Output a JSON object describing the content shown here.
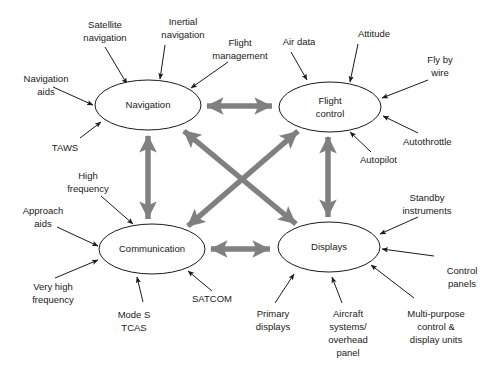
{
  "figure": {
    "background_color": "#ffffff",
    "node_stroke_color": "#1a1a1a",
    "link_color": "#808080",
    "annotation_color": "#1a1a1a"
  },
  "nodes": [
    {
      "id": "navigation",
      "label": "Navigation",
      "label_line2": "",
      "cx": 148,
      "cy": 105,
      "rx": 53,
      "ry": 25
    },
    {
      "id": "flight-control",
      "label": "Flight",
      "label_line2": "control",
      "cx": 330,
      "cy": 107,
      "rx": 51,
      "ry": 25
    },
    {
      "id": "communication",
      "label": "Communication",
      "label_line2": "",
      "cx": 152,
      "cy": 249,
      "rx": 53,
      "ry": 25
    },
    {
      "id": "displays",
      "label": "Displays",
      "label_line2": "",
      "cx": 329,
      "cy": 247,
      "rx": 51,
      "ry": 25
    }
  ],
  "links": [
    {
      "id": "nav-flight",
      "from": "navigation",
      "to": "flight-control",
      "style": "double-arrow",
      "orientation": "horizontal"
    },
    {
      "id": "comm-displays",
      "from": "communication",
      "to": "displays",
      "style": "double-arrow",
      "orientation": "horizontal"
    },
    {
      "id": "nav-comm",
      "from": "navigation",
      "to": "communication",
      "style": "double-arrow",
      "orientation": "vertical"
    },
    {
      "id": "flight-displays",
      "from": "flight-control",
      "to": "displays",
      "style": "double-arrow",
      "orientation": "vertical"
    },
    {
      "id": "nav-displays",
      "from": "navigation",
      "to": "displays",
      "style": "double-arrow",
      "orientation": "diagonal"
    },
    {
      "id": "comm-flight",
      "from": "communication",
      "to": "flight-control",
      "style": "double-arrow",
      "orientation": "diagonal"
    }
  ],
  "annotations": {
    "navigation": [
      {
        "id": "satellite-navigation",
        "line1": "Satellite",
        "line2": "navigation"
      },
      {
        "id": "inertial-navigation",
        "line1": "Inertial",
        "line2": "navigation"
      },
      {
        "id": "flight-management",
        "line1": "Flight",
        "line2": "management"
      },
      {
        "id": "navigation-aids",
        "line1": "Navigation",
        "line2": "aids"
      },
      {
        "id": "taws",
        "line1": "TAWS",
        "line2": ""
      }
    ],
    "flight_control": [
      {
        "id": "air-data",
        "line1": "Air data",
        "line2": ""
      },
      {
        "id": "attitude",
        "line1": "Attitude",
        "line2": ""
      },
      {
        "id": "fly-by-wire",
        "line1": "Fly by",
        "line2": "wire"
      },
      {
        "id": "autothrottle",
        "line1": "Autothrottle",
        "line2": ""
      },
      {
        "id": "autopilot",
        "line1": "Autopilot",
        "line2": ""
      }
    ],
    "communication": [
      {
        "id": "high-frequency",
        "line1": "High",
        "line2": "frequency"
      },
      {
        "id": "approach-aids",
        "line1": "Approach",
        "line2": "aids"
      },
      {
        "id": "very-high-frequency",
        "line1": "Very high",
        "line2": "frequency"
      },
      {
        "id": "mode-s-tcas",
        "line1": "Mode S",
        "line2": "TCAS"
      },
      {
        "id": "satcom",
        "line1": "SATCOM",
        "line2": ""
      }
    ],
    "displays": [
      {
        "id": "standby-instruments",
        "line1": "Standby",
        "line2": "instruments"
      },
      {
        "id": "control-panels",
        "line1": "Control",
        "line2": "panels"
      },
      {
        "id": "primary-displays",
        "line1": "Primary",
        "line2": "displays"
      },
      {
        "id": "aircraft-systems-overhead-panel",
        "line1": "Aircraft",
        "line2": "systems/",
        "line3": "overhead",
        "line4": "panel"
      },
      {
        "id": "multi-purpose-control-display-units",
        "line1": "Multi-purpose",
        "line2": "control &",
        "line3": "display units"
      }
    ]
  }
}
